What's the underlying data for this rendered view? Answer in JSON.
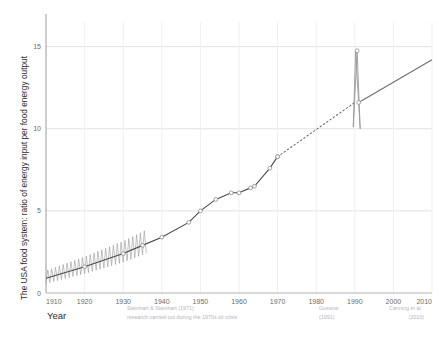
{
  "chart_data": {
    "type": "line",
    "title": "",
    "xlabel": "Year",
    "ylabel": "The USA food system: ratio of energy input per food energy output",
    "xlim": [
      1910,
      2010
    ],
    "ylim": [
      0,
      16.5
    ],
    "xticks": [
      1910,
      1920,
      1930,
      1940,
      1950,
      1960,
      1970,
      1980,
      1990,
      2000,
      2010
    ],
    "yticks": [
      0,
      5,
      10,
      15
    ],
    "grid": true,
    "legend": "none",
    "series": [
      {
        "name": "Steinhart & Steinhart measured series",
        "style": "solid-with-markers",
        "x": [
          1910,
          1920,
          1930,
          1935,
          1940,
          1947,
          1950,
          1954,
          1958,
          1960,
          1963,
          1964,
          1968,
          1970
        ],
        "values": [
          0.9,
          1.6,
          2.4,
          2.9,
          3.4,
          4.3,
          5.0,
          5.7,
          6.1,
          6.1,
          6.4,
          6.5,
          7.6,
          8.3
        ]
      },
      {
        "name": "interpolated projection 1970-1991",
        "style": "dotted",
        "x": [
          1970,
          1990
        ],
        "values": [
          8.3,
          11.6
        ]
      },
      {
        "name": "Gussow to Canning trend",
        "style": "solid",
        "x": [
          1991,
          2010
        ],
        "values": [
          11.6,
          14.2
        ]
      },
      {
        "name": "Gussow 1991 uncertainty spike",
        "style": "spike-loop",
        "x": [
          1989.6,
          1990.6,
          1991.4,
          1990.2
        ],
        "values": [
          10.1,
          14.75,
          10.0,
          14.7
        ]
      }
    ],
    "oscillation_band": {
      "note": "sawtooth oscillations about the trend, 1910-1936",
      "x_start": 1910,
      "x_end": 1936,
      "cycles": 26,
      "amplitude": 0.85
    },
    "annotations": [
      {
        "name": "steinhart-note",
        "x": 1930,
        "lines": [
          "Steinhart & Steinhart (1971)",
          "research carried out during the 1970s oil crisis"
        ]
      },
      {
        "name": "gussow-note",
        "x": 1990,
        "lines": [
          "Gussow",
          "(1991)"
        ]
      },
      {
        "name": "canning-note",
        "x": 2010,
        "lines": [
          "Canning et al.",
          "(2010)"
        ]
      }
    ],
    "colors": {
      "line": "#4a4a4a",
      "marker_stroke": "#8a8a8a",
      "grid": "#e2e2e2",
      "axis": "#9a9a9a",
      "tick_text": "#6b6b6b",
      "note_text": "#b9b2c0",
      "background": "#ffffff"
    }
  },
  "axis": {
    "y_title": "The USA food system: ratio of energy input per food energy output",
    "x_title": "Year",
    "xticks": [
      "1910",
      "1920",
      "1930",
      "1940",
      "1950",
      "1960",
      "1970",
      "1980",
      "1990",
      "2000",
      "2010"
    ],
    "yticks": [
      "0",
      "5",
      "10",
      "15"
    ]
  },
  "notes": {
    "steinhart_line1": "Steinhart & Steinhart (1971)",
    "steinhart_line2": "research carried out during the 1970s oil crisis",
    "gussow_line1": "Gussow",
    "gussow_line2": "(1991)",
    "canning_line1": "Canning et al.",
    "canning_line2": "(2010)"
  }
}
